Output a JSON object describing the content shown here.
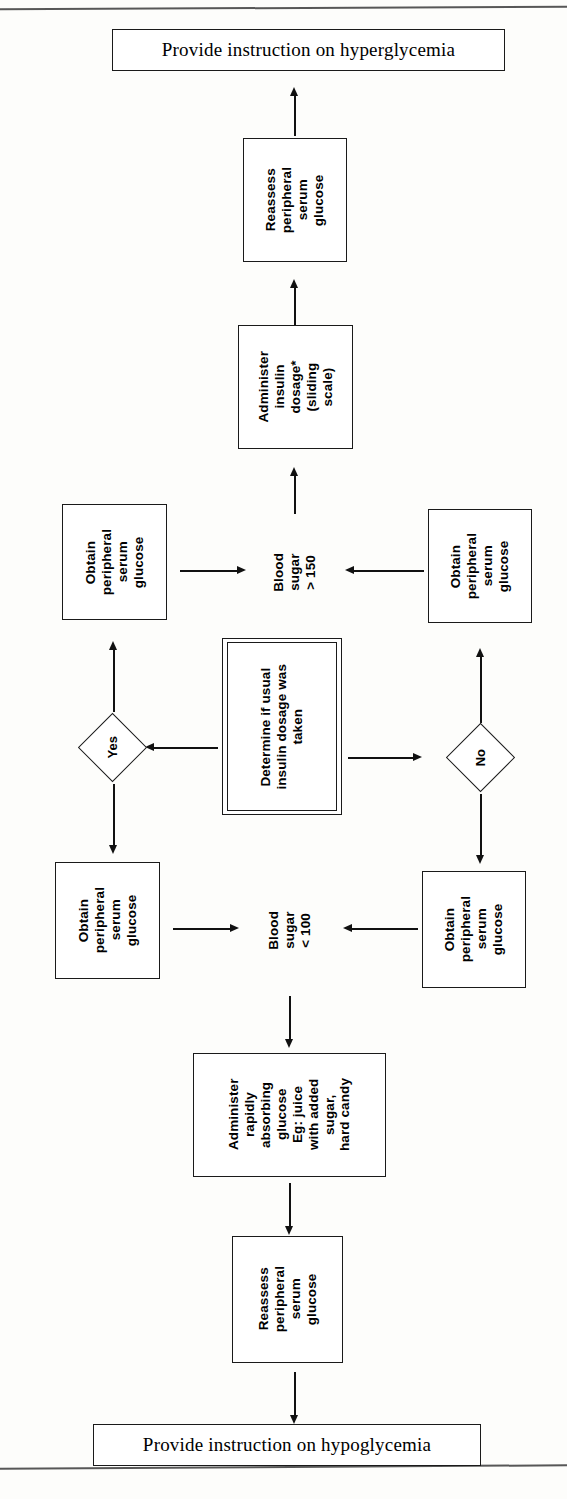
{
  "document": {
    "type": "clinical-algorithm-flowchart",
    "orientation": "interior node text rotated 90 degrees counter-clockwise"
  },
  "nodes": {
    "top_banner": "Provide instruction on hyperglycemia",
    "reassess_top": "Reassess\nperipheral\nserum\nglucose",
    "administer_insulin": "Administer\ninsulin\ndosage*\n(sliding\nscale)",
    "obtain_upper_left": "Obtain\nperipheral\nserum\nglucose",
    "obtain_upper_right": "Obtain\nperipheral\nserum\nglucose",
    "blood_sugar_high": "Blood\nsugar\n> 150",
    "decision_center": "Determine if usual\ninsulin dosage was\ntaken",
    "diamond_yes": "Yes",
    "diamond_no": "No",
    "obtain_lower_left": "Obtain\nperipheral\nserum\nglucose",
    "obtain_lower_right": "Obtain\nperipheral\nserum\nglucose",
    "blood_sugar_low": "Blood\nsugar\n< 100",
    "administer_glucose": "Administer\nrapidly\nabsorbing\nglucose\nEg: juice\nwith added\nsugar,\nhard candy",
    "reassess_bottom": "Reassess\nperipheral\nserum\nglucose",
    "bottom_banner": "Provide instruction on hypoglycemia"
  },
  "colors": {
    "ink": "#1a1a1a",
    "paper": "#fdfdfb",
    "connector": "#111111"
  }
}
